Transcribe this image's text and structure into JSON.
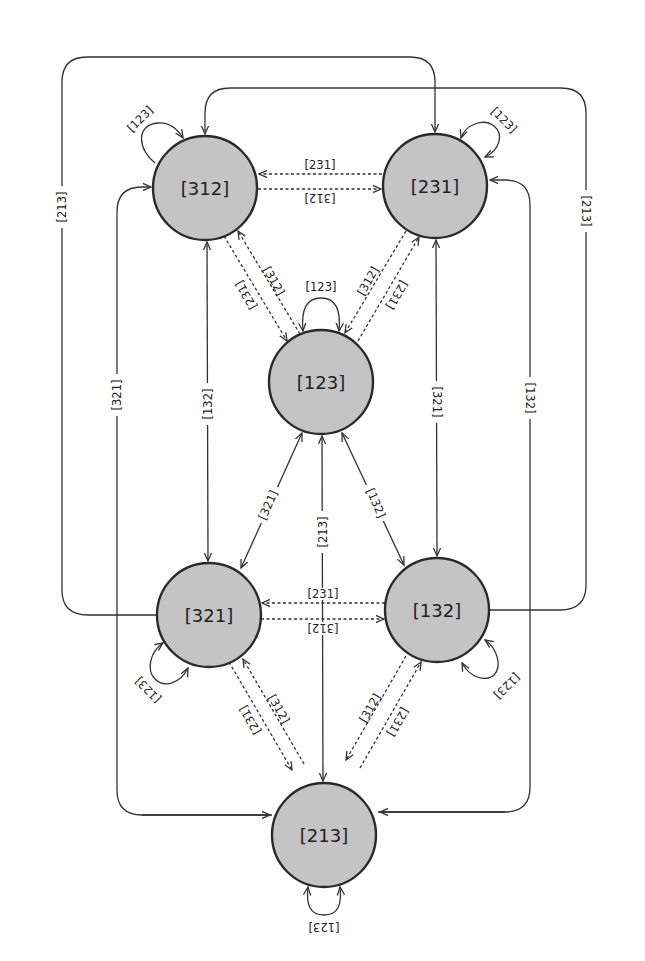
{
  "diagram": {
    "type": "state-transition-graph",
    "style": {
      "node_fill": "#c4c4c4",
      "node_stroke": "#2a2a2a",
      "edge_color": "#333333",
      "background": "#ffffff"
    },
    "nodes": [
      {
        "id": "312",
        "label": "[312]",
        "cx": 205,
        "cy": 188
      },
      {
        "id": "231",
        "label": "[231]",
        "cx": 435,
        "cy": 186
      },
      {
        "id": "123",
        "label": "[123]",
        "cx": 321,
        "cy": 382
      },
      {
        "id": "321",
        "label": "[321]",
        "cx": 209,
        "cy": 615
      },
      {
        "id": "132",
        "label": "[132]",
        "cx": 437,
        "cy": 610
      },
      {
        "id": "213",
        "label": "[213]",
        "cx": 324,
        "cy": 835
      }
    ],
    "edges": [
      {
        "id": "e1",
        "from": "312",
        "to": "312",
        "label": "[123]",
        "style": "solid",
        "kind": "self-loop"
      },
      {
        "id": "e2",
        "from": "231",
        "to": "231",
        "label": "[123]",
        "style": "solid",
        "kind": "self-loop"
      },
      {
        "id": "e3",
        "from": "123",
        "to": "123",
        "label": "[123]",
        "style": "solid",
        "kind": "self-loop"
      },
      {
        "id": "e4",
        "from": "321",
        "to": "321",
        "label": "[123]",
        "style": "solid",
        "kind": "self-loop"
      },
      {
        "id": "e5",
        "from": "132",
        "to": "132",
        "label": "[123]",
        "style": "solid",
        "kind": "self-loop"
      },
      {
        "id": "e6",
        "from": "213",
        "to": "213",
        "label": "[123]",
        "style": "solid",
        "kind": "self-loop"
      },
      {
        "id": "e7",
        "from": "231",
        "to": "312",
        "label": "[231]",
        "style": "dashed"
      },
      {
        "id": "e8",
        "from": "312",
        "to": "231",
        "label": "[312]",
        "style": "dashed"
      },
      {
        "id": "e9",
        "from": "312",
        "to": "123",
        "label": "[231]",
        "style": "dashed"
      },
      {
        "id": "e10",
        "from": "123",
        "to": "312",
        "label": "[312]",
        "style": "dashed"
      },
      {
        "id": "e11",
        "from": "231",
        "to": "123",
        "label": "[312]",
        "style": "dashed"
      },
      {
        "id": "e12",
        "from": "123",
        "to": "231",
        "label": "[231]",
        "style": "dashed"
      },
      {
        "id": "e13",
        "from": "312",
        "to": "321",
        "label": "[132]",
        "style": "solid",
        "kind": "bidirectional"
      },
      {
        "id": "e14",
        "from": "231",
        "to": "132",
        "label": "[321]",
        "style": "solid",
        "kind": "bidirectional"
      },
      {
        "id": "e15",
        "from": "123",
        "to": "321",
        "label": "[321]",
        "style": "solid",
        "kind": "bidirectional"
      },
      {
        "id": "e16",
        "from": "123",
        "to": "132",
        "label": "[132]",
        "style": "solid",
        "kind": "bidirectional"
      },
      {
        "id": "e17",
        "from": "123",
        "to": "213",
        "label": "[213]",
        "style": "solid",
        "kind": "bidirectional"
      },
      {
        "id": "e18",
        "from": "132",
        "to": "321",
        "label": "[231]",
        "style": "dashed"
      },
      {
        "id": "e19",
        "from": "321",
        "to": "132",
        "label": "[312]",
        "style": "dashed"
      },
      {
        "id": "e20",
        "from": "321",
        "to": "213",
        "label": "[231]",
        "style": "dashed"
      },
      {
        "id": "e21",
        "from": "213",
        "to": "321",
        "label": "[312]",
        "style": "dashed"
      },
      {
        "id": "e22",
        "from": "132",
        "to": "213",
        "label": "[312]",
        "style": "dashed"
      },
      {
        "id": "e23",
        "from": "213",
        "to": "132",
        "label": "[231]",
        "style": "dashed"
      },
      {
        "id": "e24",
        "from": "321",
        "to": "231",
        "label": "[213]",
        "style": "solid",
        "kind": "outer-loop-left-top"
      },
      {
        "id": "e25",
        "from": "132",
        "to": "312",
        "label": "[213]",
        "style": "solid",
        "kind": "outer-loop-right-top"
      },
      {
        "id": "e26",
        "from": "213",
        "to": "312",
        "label": "[321]",
        "style": "solid",
        "kind": "outer-loop-left"
      },
      {
        "id": "e27",
        "from": "213",
        "to": "231",
        "label": "[132]",
        "style": "solid",
        "kind": "outer-loop-right"
      }
    ]
  }
}
